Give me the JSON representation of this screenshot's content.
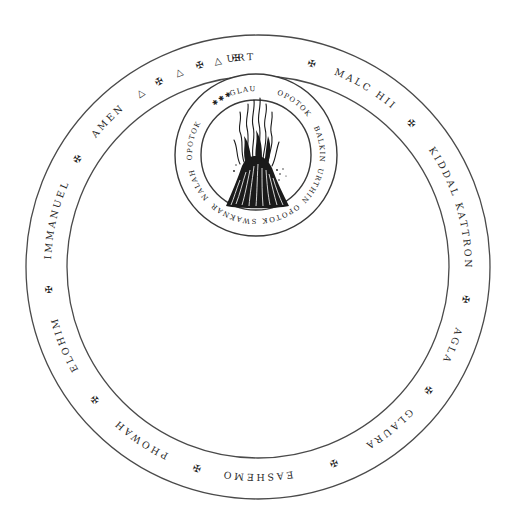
{
  "seal": {
    "title": "Magic seal with flame",
    "colors": {
      "ink": "#2a2a2a",
      "background": "#ffffff",
      "line": "#4a4a4a"
    },
    "outer_ring": {
      "center": [
        258,
        267
      ],
      "outer_radius": 232,
      "inner_radius": 191,
      "text_radius": 207,
      "items": [
        {
          "type": "word",
          "text": "URTHIN",
          "angle": -1
        },
        {
          "type": "cross",
          "text": "✠",
          "angle": 15
        },
        {
          "type": "word",
          "text": "MALC HII",
          "angle": 31
        },
        {
          "type": "cross",
          "text": "✠",
          "angle": 47
        },
        {
          "type": "word",
          "text": "KIDDAL KATTRON",
          "angle": 73
        },
        {
          "type": "cross",
          "text": "✠",
          "angle": 99
        },
        {
          "type": "word",
          "text": "AGLA",
          "angle": 112
        },
        {
          "type": "cross",
          "text": "✠",
          "angle": 126
        },
        {
          "type": "word",
          "text": "GLAURA",
          "angle": 141
        },
        {
          "type": "cross",
          "text": "✠",
          "angle": 159
        },
        {
          "type": "word",
          "text": "EASHEMO",
          "angle": 180
        },
        {
          "type": "cross",
          "text": "✠",
          "angle": 197
        },
        {
          "type": "word",
          "text": "PHOWAH",
          "angle": 214
        },
        {
          "type": "cross",
          "text": "✠",
          "angle": 231
        },
        {
          "type": "word",
          "text": "ELOHIM",
          "angle": 248
        },
        {
          "type": "cross",
          "text": "✠",
          "angle": 264
        },
        {
          "type": "word",
          "text": "IMMANUEL",
          "angle": 283
        },
        {
          "type": "cross",
          "text": "✠",
          "angle": 301
        },
        {
          "type": "word",
          "text": "AMEN",
          "angle": 314
        },
        {
          "type": "triangle",
          "text": "△",
          "angle": 326
        },
        {
          "type": "cross",
          "text": "✠",
          "angle": 332
        },
        {
          "type": "triangle",
          "text": "△",
          "angle": 338
        },
        {
          "type": "cross",
          "text": "✠",
          "angle": 344
        },
        {
          "type": "triangle",
          "text": "△",
          "angle": 349
        },
        {
          "type": "cross",
          "text": "✠",
          "angle": 354
        }
      ]
    },
    "inner_seal": {
      "center": [
        256,
        155
      ],
      "outer_radius": 81,
      "inner_radius": 55,
      "text_radius": 64,
      "items": [
        {
          "type": "stars",
          "text": "✱✱✱",
          "angle": -32
        },
        {
          "type": "word",
          "text": "GLAURON",
          "angle": -3
        },
        {
          "type": "word",
          "text": "OPOTOK",
          "angle": 36
        },
        {
          "type": "word",
          "text": "BALKIN",
          "angle": 80
        },
        {
          "type": "word",
          "text": "URTHIN",
          "angle": 118
        },
        {
          "type": "word",
          "text": "OPOTOK",
          "angle": 157
        },
        {
          "type": "word",
          "text": "SWAKNAR",
          "angle": 200
        },
        {
          "type": "word",
          "text": "NALAH",
          "angle": 242
        },
        {
          "type": "word",
          "text": "OPOTOK",
          "angle": 282
        }
      ],
      "center_image": "flame-icon"
    }
  }
}
